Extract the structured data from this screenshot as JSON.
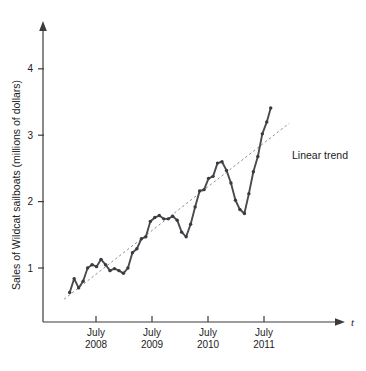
{
  "chart_data": {
    "type": "line",
    "title": "",
    "subtitle": "",
    "xlabel": "t",
    "ylabel": "Sales of Wildcat sailboats (millions of dollars)",
    "grid": false,
    "legend_position": "inline-annotation",
    "xlim": [
      2007.75,
      2011.95
    ],
    "ylim": [
      0,
      4.5
    ],
    "yticks": [
      1,
      2,
      3,
      4
    ],
    "ytick_labels": [
      "1",
      "2",
      "3",
      "4"
    ],
    "xticks": [
      2008.5,
      2009.5,
      2010.5,
      2011.5
    ],
    "xtick_labels": [
      {
        "month": "July",
        "year": "2008"
      },
      {
        "month": "July",
        "year": "2009"
      },
      {
        "month": "July",
        "year": "2010"
      },
      {
        "month": "July",
        "year": "2011"
      }
    ],
    "series": [
      {
        "name": "Sales of Wildcat sailboats",
        "markers": true,
        "x": [
          2008.03,
          2008.11,
          2008.19,
          2008.27,
          2008.35,
          2008.43,
          2008.51,
          2008.59,
          2008.67,
          2008.75,
          2008.83,
          2008.91,
          2008.99,
          2009.07,
          2009.15,
          2009.23,
          2009.31,
          2009.39,
          2009.47,
          2009.55,
          2009.63,
          2009.71,
          2009.79,
          2009.87,
          2009.95,
          2010.03,
          2010.11,
          2010.19,
          2010.27,
          2010.35,
          2010.43,
          2010.51,
          2010.59,
          2010.67,
          2010.75,
          2010.83,
          2010.91,
          2010.99,
          2011.07,
          2011.15,
          2011.23,
          2011.31,
          2011.39,
          2011.47,
          2011.55
        ],
        "y": [
          0.63,
          0.84,
          0.7,
          0.8,
          1.0,
          1.05,
          1.02,
          1.13,
          1.05,
          0.96,
          0.99,
          0.96,
          0.92,
          1.0,
          1.23,
          1.29,
          1.44,
          1.47,
          1.7,
          1.76,
          1.79,
          1.74,
          1.74,
          1.78,
          1.72,
          1.54,
          1.47,
          1.66,
          1.92,
          2.16,
          2.18,
          2.35,
          2.38,
          2.58,
          2.6,
          2.47,
          2.28,
          2.02,
          1.88,
          1.82,
          2.12,
          2.45,
          2.68,
          3.02,
          3.2
        ]
      }
    ],
    "trend": {
      "name": "Linear trend",
      "label": "Linear trend",
      "style": "dotted",
      "x": [
        2007.93,
        2011.95
      ],
      "y": [
        0.53,
        3.18
      ]
    },
    "final_point": {
      "x": 2011.62,
      "y": 3.41
    },
    "annotations": [
      {
        "text": "Linear trend",
        "x": 2011.95,
        "y": 2.5
      }
    ],
    "colors": {
      "series": "#4a4a4f",
      "marker": "#3a3a40",
      "trend": "#8d8d93",
      "axis": "#3b3b3b",
      "text": "#1c1c1c",
      "background": "#ffffff"
    }
  }
}
